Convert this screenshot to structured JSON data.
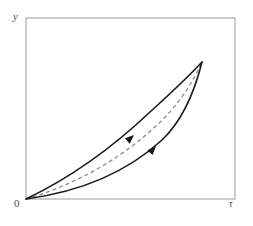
{
  "figure": {
    "title": "",
    "caption": "",
    "background_color": "#ffffff"
  },
  "labels": {
    "y_axis": "y",
    "origin": "0",
    "x_axis": "τ"
  },
  "colors": {
    "frame": "#9a9a9a",
    "curve": "#1a1a1a",
    "dashed": "#8c8c8c",
    "label": "#4a4a4a",
    "background": "#ffffff"
  },
  "chart_data": {
    "type": "line",
    "title": "",
    "xlabel": "τ",
    "ylabel": "y",
    "grid": false,
    "legend": null,
    "axis_frame": {
      "left": 26,
      "top": 18,
      "right": 235,
      "bottom": 199
    },
    "xlim": [
      0,
      1
    ],
    "ylim": [
      0,
      1
    ],
    "xticks": [
      0,
      1
    ],
    "xticklabels": [
      "0",
      "τ"
    ],
    "yticks": [],
    "yticklabels": [],
    "annotations": [
      {
        "name": "arrowhead-upper-curve",
        "x": 134,
        "y": 135,
        "direction": "up-right",
        "on_series": "upper-curve"
      },
      {
        "name": "arrowhead-lower-curve",
        "x": 156,
        "y": 146,
        "direction": "up-right",
        "on_series": "lower-curve"
      }
    ],
    "start_point": [
      26,
      199
    ],
    "end_point": [
      202,
      62
    ],
    "series": [
      {
        "name": "upper-curve",
        "style": "solid",
        "color": "#1a1a1a",
        "width": 1.6,
        "description": "Solid curve bowing above the chord from origin to apex",
        "path": "M26,199 C70,178 112,148 150,112 C172,92 190,75 202,62",
        "points": [
          [
            26,
            199
          ],
          [
            48,
            189
          ],
          [
            70,
            178
          ],
          [
            91,
            163
          ],
          [
            112,
            148
          ],
          [
            131,
            130
          ],
          [
            150,
            112
          ],
          [
            172,
            92
          ],
          [
            190,
            75
          ],
          [
            202,
            62
          ]
        ]
      },
      {
        "name": "lower-curve",
        "style": "solid",
        "color": "#1a1a1a",
        "width": 1.6,
        "description": "Solid curve bowing below the chord from origin to apex",
        "path": "M26,199 C78,192 126,173 162,140 C182,121 195,90 202,62",
        "points": [
          [
            26,
            199
          ],
          [
            52,
            196
          ],
          [
            78,
            192
          ],
          [
            102,
            184
          ],
          [
            126,
            173
          ],
          [
            145,
            158
          ],
          [
            162,
            140
          ],
          [
            182,
            121
          ],
          [
            195,
            90
          ],
          [
            202,
            62
          ]
        ]
      },
      {
        "name": "mean-path",
        "style": "dashed",
        "color": "#8c8c8c",
        "width": 1.3,
        "dasharray": "4,3",
        "description": "Dashed mid-line between the two solid curves",
        "path": "M26,199 C74,185 118,161 156,126 C177,107 192,84 202,62",
        "points": [
          [
            26,
            199
          ],
          [
            50,
            192
          ],
          [
            74,
            185
          ],
          [
            96,
            174
          ],
          [
            118,
            161
          ],
          [
            137,
            144
          ],
          [
            156,
            126
          ],
          [
            177,
            107
          ],
          [
            192,
            84
          ],
          [
            202,
            62
          ]
        ]
      }
    ]
  }
}
